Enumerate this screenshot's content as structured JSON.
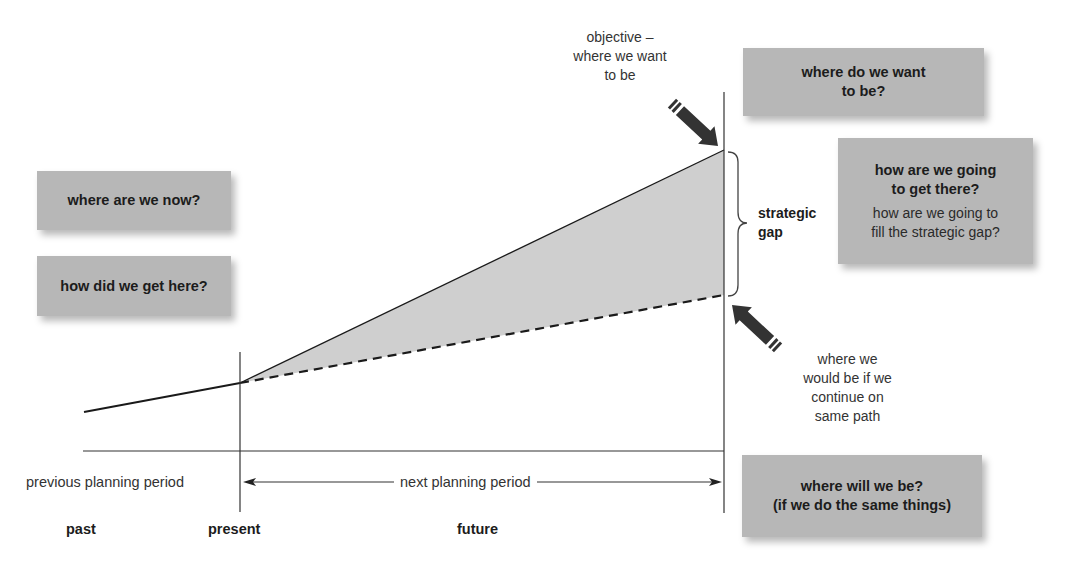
{
  "diagram": {
    "colors": {
      "box_fill": "#b7b7b7",
      "gap_fill": "#cfcfcf",
      "line": "#1a1a1a",
      "arrow": "#333333"
    },
    "question_boxes": {
      "where_now": {
        "bold": "where are we now?"
      },
      "how_here": {
        "bold": "how did we get here?"
      },
      "where_want": {
        "bold_line1": "where do we want",
        "bold_line2": "to be?"
      },
      "how_get_there": {
        "bold_line1": "how are we going",
        "bold_line2": "to get there?",
        "normal_line1": "how are we going to",
        "normal_line2": "fill the strategic gap?"
      },
      "where_will_be": {
        "bold_line1": "where will we be?",
        "bold_line2": "(if we do the same things)"
      }
    },
    "annotations": {
      "objective": {
        "line1": "objective –",
        "line2": "where we want",
        "line3": "to be"
      },
      "same_path": {
        "line1": "where we",
        "line2": "would be if we",
        "line3": "continue on",
        "line4": "same path"
      },
      "strategic_gap": {
        "line1": "strategic",
        "line2": "gap"
      }
    },
    "timeline": {
      "previous_period": "previous planning period",
      "next_period": "next planning period",
      "periods": {
        "past": "past",
        "present": "present",
        "future": "future"
      }
    },
    "lines": {
      "past_line": {
        "from": [
          84,
          412
        ],
        "to": [
          240,
          383
        ]
      },
      "objective_line": {
        "from": [
          240,
          383
        ],
        "to": [
          724,
          150
        ]
      },
      "same_path_line": {
        "from": [
          240,
          383
        ],
        "to": [
          724,
          295
        ],
        "style": "dashed"
      },
      "present_marker_x": 240,
      "future_end_x": 724,
      "baseline_y": 451
    }
  }
}
